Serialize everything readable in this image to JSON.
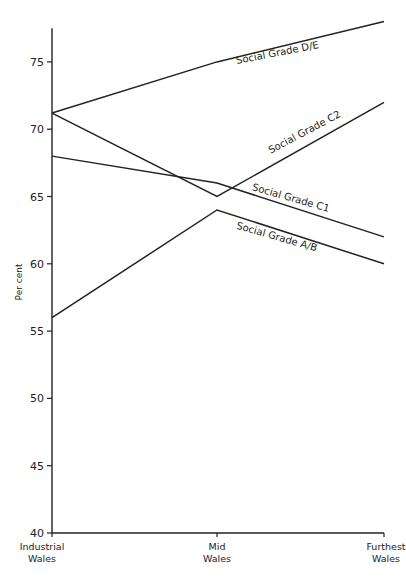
{
  "chart_data": {
    "type": "line",
    "title": "",
    "xlabel": "",
    "ylabel": "Per cent",
    "ylim": [
      40,
      77.5
    ],
    "yticks": [
      40,
      45,
      50,
      55,
      60,
      65,
      70,
      75
    ],
    "categories": [
      "Industrial Wales",
      "Mid Wales",
      "Furthest Wales"
    ],
    "category_lines": [
      [
        "Industrial",
        "Wales"
      ],
      [
        "Mid",
        "Wales"
      ],
      [
        "Furthest",
        "Wales"
      ]
    ],
    "grid": false,
    "legend": "inline labels at line ends",
    "series": [
      {
        "name": "Social Grade D/E",
        "values": [
          71.2,
          75,
          78
        ]
      },
      {
        "name": "Social Grade C2",
        "values": [
          71.2,
          65,
          72
        ]
      },
      {
        "name": "Social Grade C1",
        "values": [
          68,
          66,
          62
        ]
      },
      {
        "name": "Social Grade A/B",
        "values": [
          56,
          64,
          60
        ]
      }
    ],
    "labels": [
      {
        "series": "Social Grade D/E",
        "text": "Social Grade D/E",
        "x": 278,
        "y": 56,
        "angle": -11
      },
      {
        "series": "Social Grade C2",
        "text": "Social Grade C2",
        "x": 306,
        "y": 135,
        "angle": -28
      },
      {
        "series": "Social Grade C1",
        "text": "Social Grade C1",
        "x": 290,
        "y": 201,
        "angle": 16
      },
      {
        "series": "Social Grade A/B",
        "text": "Social Grade A/B",
        "x": 276,
        "y": 240,
        "angle": 16
      }
    ]
  }
}
